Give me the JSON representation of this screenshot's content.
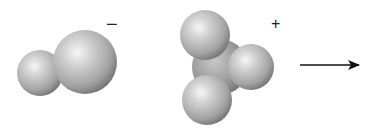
{
  "diagram": {
    "type": "space-filling molecular models",
    "molecules": [
      {
        "id": "anion",
        "label": "diatomic anion",
        "charge_symbol": "−",
        "atoms": [
          {
            "role": "small",
            "cx": 40,
            "cy": 73,
            "r": 23
          },
          {
            "role": "large",
            "cx": 85,
            "cy": 62,
            "r": 32
          }
        ]
      },
      {
        "id": "cation",
        "label": "trigonal cation",
        "charge_symbol": "+",
        "atoms": [
          {
            "role": "central",
            "cx": 220,
            "cy": 67,
            "r": 28
          },
          {
            "role": "top",
            "cx": 205,
            "cy": 35,
            "r": 25
          },
          {
            "role": "right",
            "cx": 251,
            "cy": 67,
            "r": 23
          },
          {
            "role": "bottom",
            "cx": 207,
            "cy": 100,
            "r": 25
          }
        ]
      }
    ],
    "arrow": {
      "x1": 300,
      "y1": 65,
      "x2": 359,
      "y2": 65,
      "direction": "right"
    },
    "colors": {
      "sphere_highlight": "#f4f4f4",
      "sphere_mid": "#b8b8b8",
      "sphere_shadow": "#6e6e6e",
      "arrow": "#111111",
      "background": "#ffffff"
    }
  }
}
